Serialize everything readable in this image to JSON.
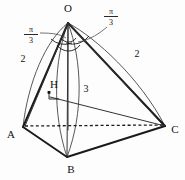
{
  "figure": {
    "type": "solid-geometry-diagram",
    "stroke_color": "#1a1a1a",
    "background_color": "#ffffff",
    "vertices": [
      {
        "id": "O",
        "label": "O",
        "x": 68,
        "y": 22,
        "label_x": 68,
        "label_y": 12
      },
      {
        "id": "A",
        "label": "A",
        "x": 23,
        "y": 127,
        "label_x": 11,
        "label_y": 138
      },
      {
        "id": "B",
        "label": "B",
        "x": 67,
        "y": 157,
        "label_x": 71,
        "label_y": 173
      },
      {
        "id": "C",
        "label": "C",
        "x": 165,
        "y": 126,
        "label_x": 175,
        "label_y": 133
      },
      {
        "id": "H",
        "label": "H",
        "x": 68,
        "y": 97,
        "label_x": 54,
        "label_y": 88
      }
    ],
    "measures": [
      {
        "id": "edge-OA-length",
        "label": "2",
        "x": 23,
        "y": 62
      },
      {
        "id": "edge-OC-length",
        "label": "2",
        "x": 137,
        "y": 57
      },
      {
        "id": "segment-HC-length",
        "label": "3",
        "x": 86,
        "y": 92
      },
      {
        "id": "apex-angle-left",
        "numerator": "π",
        "denominator": "3",
        "x": 31,
        "y": 34
      },
      {
        "id": "apex-angle-right",
        "numerator": "π",
        "denominator": "3",
        "x": 111,
        "y": 16
      }
    ],
    "annotations": {
      "right_angle_at_h": "perpendicular mark at H",
      "apex_angle_marks": "two small arcs at apex O"
    }
  }
}
